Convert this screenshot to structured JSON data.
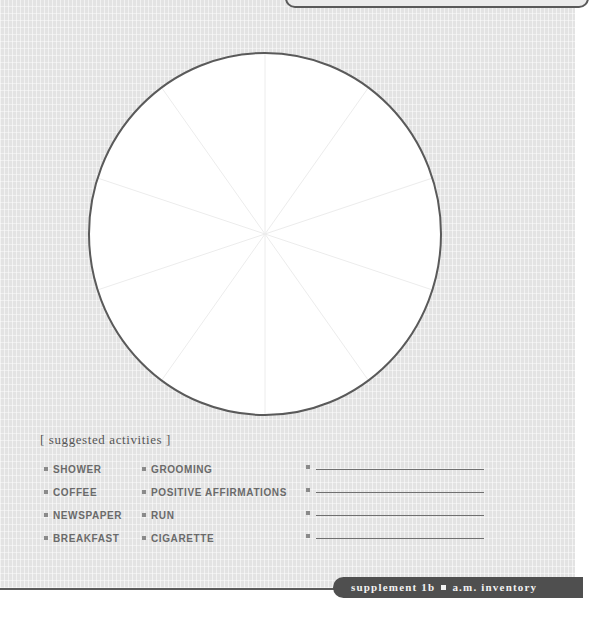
{
  "worksheet": {
    "clock_diagram": {
      "shape": "circle",
      "segments": 10,
      "fill": "#ffffff",
      "outline_color": "#5a5a5a",
      "divider_color": "#ececec"
    },
    "suggested_activities": {
      "title": "[ suggested activities ]",
      "column_1": [
        "SHOWER",
        "COFFEE",
        "NEWSPAPER",
        "BREAKFAST"
      ],
      "column_2": [
        "GROOMING",
        "POSITIVE AFFIRMATIONS",
        "RUN",
        "CIGARETTE"
      ],
      "blank_entries": [
        "",
        "",
        "",
        ""
      ]
    },
    "footer": {
      "label_left": "supplement 1b",
      "label_right": "a.m. inventory"
    }
  }
}
